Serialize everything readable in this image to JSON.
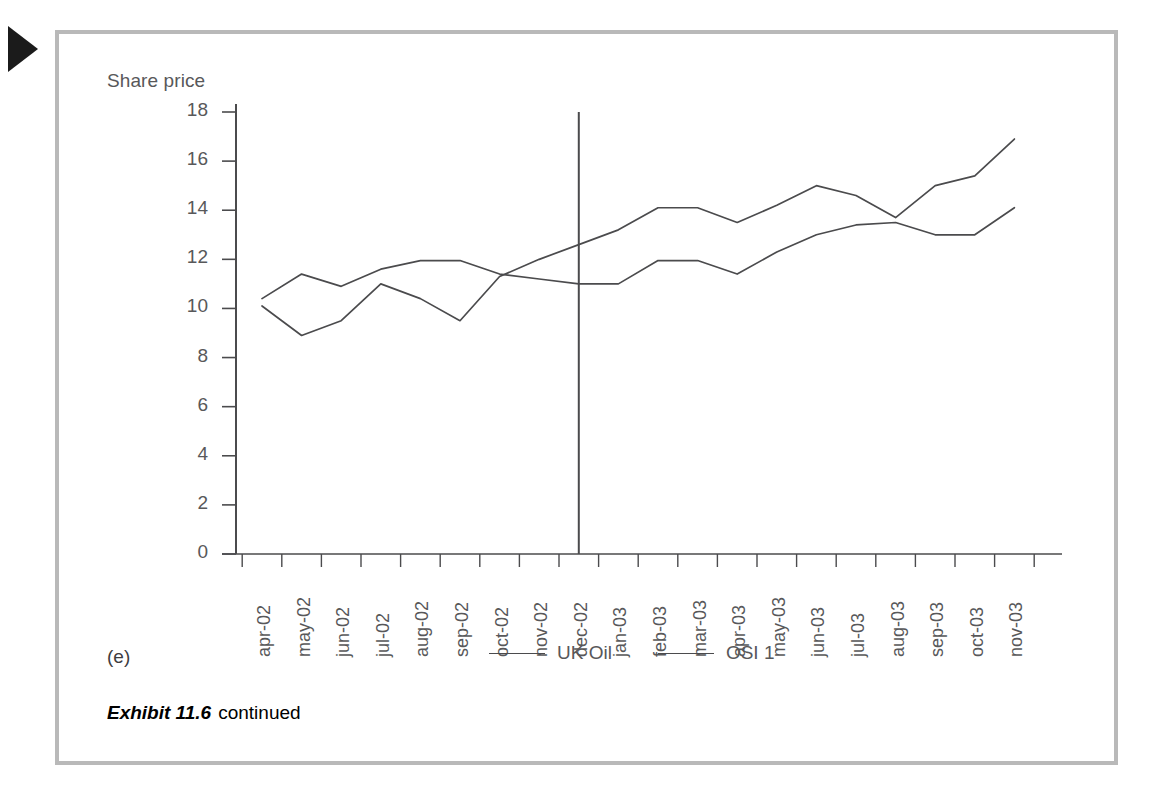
{
  "figure": {
    "panel_letter": "(e)",
    "caption_strong": "Exhibit 11.6",
    "caption_rest": "continued",
    "marker_icon": "play-triangle-icon",
    "frame_color": "#b9b9b9"
  },
  "legend": {
    "position": "bottom-center",
    "items": [
      {
        "label": "UK Oil",
        "color": "#4b4b4d"
      },
      {
        "label": "OSI 1",
        "color": "#4b4b4d"
      }
    ]
  },
  "annotations": {
    "vertical_reference_line": {
      "at_category": "dec-02",
      "from_value": 0,
      "to_value": 18,
      "color": "#4b4b4d"
    }
  },
  "chart_data": {
    "type": "line",
    "title": "",
    "ylabel": "Share price",
    "xlabel": "",
    "ylim": [
      0,
      18
    ],
    "yticks": [
      0,
      2,
      4,
      6,
      8,
      10,
      12,
      14,
      16,
      18
    ],
    "grid": false,
    "categories": [
      "apr-02",
      "may-02",
      "jun-02",
      "jul-02",
      "aug-02",
      "sep-02",
      "oct-02",
      "nov-02",
      "dec-02",
      "jan-03",
      "feb-03",
      "mar-03",
      "apr-03",
      "may-03",
      "jun-03",
      "jul-03",
      "aug-03",
      "sep-03",
      "oct-03",
      "nov-03"
    ],
    "series": [
      {
        "name": "UK Oil",
        "color": "#4b4b4d",
        "values": [
          10.1,
          8.9,
          9.5,
          11.0,
          10.4,
          9.5,
          11.3,
          12.0,
          12.6,
          13.2,
          14.1,
          14.1,
          13.5,
          14.2,
          15.0,
          14.6,
          13.7,
          15.0,
          15.4,
          16.9
        ]
      },
      {
        "name": "OSI 1",
        "color": "#4b4b4d",
        "values": [
          10.4,
          11.4,
          10.9,
          11.6,
          11.95,
          11.95,
          11.4,
          11.2,
          11.0,
          11.0,
          11.95,
          11.95,
          11.4,
          12.3,
          13.0,
          13.4,
          13.5,
          13.0,
          13.0,
          14.1
        ]
      }
    ]
  }
}
